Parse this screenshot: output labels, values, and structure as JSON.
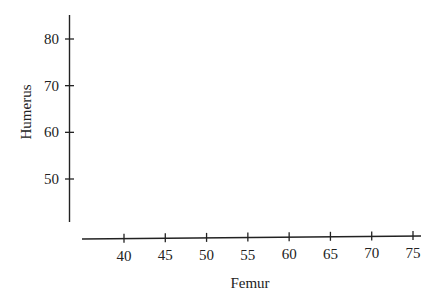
{
  "chart_data": {
    "type": "scatter",
    "title": "",
    "xlabel": "Femur",
    "ylabel": "Humerus",
    "x_ticks": [
      40,
      45,
      50,
      55,
      60,
      65,
      70,
      75
    ],
    "y_ticks": [
      50,
      60,
      70,
      80
    ],
    "xlim": [
      35,
      76
    ],
    "ylim": [
      40,
      85
    ],
    "grid": false,
    "legend": null,
    "series": [],
    "note": "Empty axes for plotting; no data points shown"
  },
  "colors": {
    "axis": "#222222",
    "background": "#ffffff"
  }
}
